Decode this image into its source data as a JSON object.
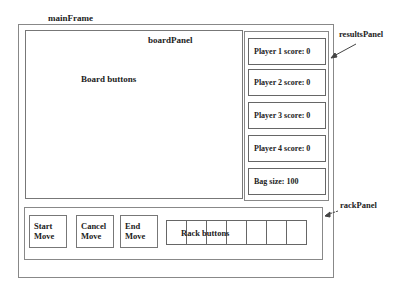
{
  "labels": {
    "main_frame": "mainFrame",
    "board_panel": "boardPanel",
    "results_panel": "resultsPanel",
    "rack_panel": "rackPanel"
  },
  "board": {
    "content": "Board buttons"
  },
  "results": {
    "items": [
      {
        "label": "Player 1 score: 0"
      },
      {
        "label": "Player 2 score: 0"
      },
      {
        "label": "Player 3 score: 0"
      },
      {
        "label": "Player 4 score: 0"
      },
      {
        "label": "Bag size: 100"
      }
    ]
  },
  "rack": {
    "buttons": [
      {
        "line1": "Start",
        "line2": "Move"
      },
      {
        "line1": "Cancel",
        "line2": "Move"
      },
      {
        "line1": "End",
        "line2": "Move"
      }
    ],
    "rack_label": "Rack buttons",
    "cell_count": 7
  }
}
